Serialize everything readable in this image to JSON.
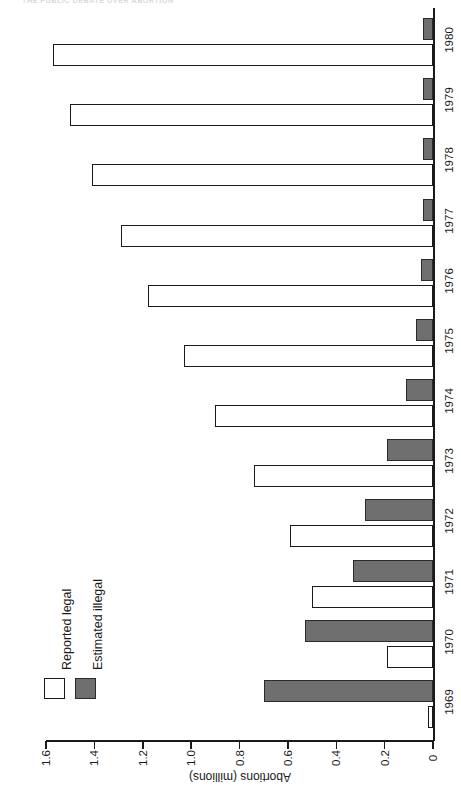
{
  "header": {
    "clipped_title": "THE PUBLIC DEBATE OVER ABORTION"
  },
  "legend": {
    "position": "upper-left",
    "items": [
      {
        "label": "Reported legal",
        "swatch": "open-square-white",
        "color": "#ffffff"
      },
      {
        "label": "Estimated illegal",
        "swatch": "filled-square-gray",
        "color": "#6f6f6f"
      }
    ]
  },
  "axes": {
    "value_axis_title": "Abortions (millions)",
    "value_ticks": [
      "0",
      "0.2",
      "0.4",
      "0.6",
      "0.8",
      "1.0",
      "1.2",
      "1.4",
      "1.6"
    ],
    "value_min": 0,
    "value_max": 1.6,
    "category_axis_title": ""
  },
  "chart_data": {
    "type": "bar",
    "title": "",
    "subtitle": "",
    "orientation": "horizontal",
    "grid": false,
    "legend_position": "upper-left",
    "xlabel": "Abortions (millions)",
    "ylabel": "",
    "xlim": [
      0,
      1.6
    ],
    "categories": [
      "1969",
      "1970",
      "1971",
      "1972",
      "1973",
      "1974",
      "1975",
      "1976",
      "1977",
      "1978",
      "1979",
      "1980"
    ],
    "series": [
      {
        "name": "Reported legal",
        "color": "#ffffff",
        "values": [
          0.02,
          0.19,
          0.5,
          0.59,
          0.74,
          0.9,
          1.03,
          1.18,
          1.29,
          1.41,
          1.5,
          1.57
        ]
      },
      {
        "name": "Estimated illegal",
        "color": "#6f6f6f",
        "values": [
          0.7,
          0.53,
          0.33,
          0.28,
          0.19,
          0.11,
          0.07,
          0.05,
          0.04,
          0.04,
          0.04,
          0.04
        ]
      }
    ]
  }
}
